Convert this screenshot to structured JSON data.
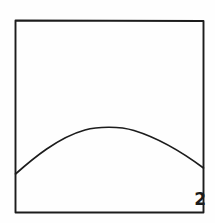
{
  "figure": {
    "label": "2",
    "kind": "line-drawing",
    "background_color": "#fefefe",
    "ink_color": "#1c1c1c"
  },
  "frame": {
    "name": "panel-border",
    "shape": "rectangle",
    "left": 15,
    "top": 20,
    "right": 204,
    "bottom": 213,
    "stroke_width": 1.9
  },
  "chart_data": {
    "type": "line",
    "title": "",
    "subtitle": "",
    "xlabel": "",
    "ylabel": "",
    "grid": false,
    "legend": "none",
    "annotations": [
      "2"
    ],
    "xlim": [
      15,
      204
    ],
    "ylim": [
      213,
      20
    ],
    "series": [
      {
        "name": "arch",
        "x": [
          15,
          30,
          45,
          60,
          75,
          90,
          105,
          110,
          125,
          140,
          155,
          170,
          185,
          204
        ],
        "y": [
          174,
          161,
          151,
          143,
          136,
          131,
          128,
          127,
          128,
          131,
          136,
          144,
          154,
          168
        ]
      }
    ]
  },
  "paths": {
    "frame_d": "M 15.5 20.5 L 203.5 21 L 203.5 212.5 L 15.5 212.5 Z",
    "curve_d": "M 15.5 174 C 33 158.5 58 137.5 85 130 C 98 126.3 120 126.2 134 130.5 C 160 138.5 186 155 203.5 168"
  }
}
